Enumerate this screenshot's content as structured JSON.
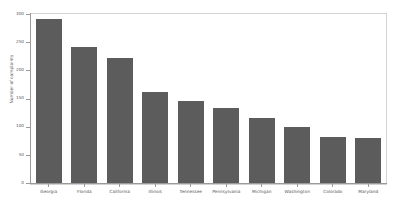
{
  "chart_data": {
    "type": "bar",
    "title": "",
    "xlabel": "",
    "ylabel": "Number of complaints",
    "ylim": [
      0,
      300
    ],
    "yticks": [
      0,
      50,
      100,
      150,
      200,
      250,
      300
    ],
    "ytick_labels": [
      "0",
      "50",
      "100",
      "150",
      "200",
      "250",
      "300"
    ],
    "grid": false,
    "legend": false,
    "bar_color": "#5c5c5c",
    "categories": [
      "Georgia",
      "Florida",
      "California",
      "Illinois",
      "Tennessee",
      "Pennsylvania",
      "Michigan",
      "Washington",
      "Colorado",
      "Maryland"
    ],
    "values": [
      291,
      241,
      222,
      161,
      145,
      134,
      116,
      100,
      81,
      80
    ]
  },
  "figure": {
    "background_color": "#ffffff",
    "axis_color": "#9a9a9a",
    "frame_color": "#d2d2d2",
    "text_color": "#555555"
  }
}
